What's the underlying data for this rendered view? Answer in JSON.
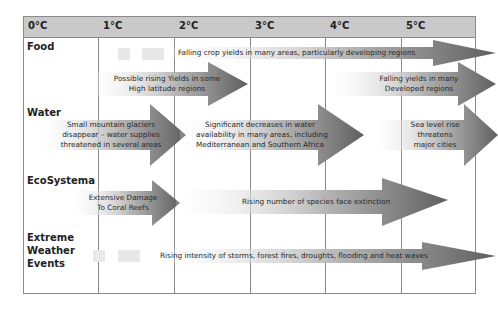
{
  "columns": [
    "0°C",
    "1°C",
    "2°C",
    "3°C",
    "4°C",
    "5°C"
  ],
  "rows": [
    {
      "label": "Food"
    },
    {
      "label": "Water"
    },
    {
      "label": "EcoSystema"
    },
    {
      "label_lines": [
        "Extreme",
        "Weather",
        "Events"
      ]
    }
  ],
  "impacts": {
    "food_falling_crop": "Falling crop yields in many areas, particularly developing regions",
    "food_rising_yields": [
      "Possible rising Yields in some",
      "High latitude regions"
    ],
    "food_falling_developed": [
      "Falling yields in many",
      "Developed regions"
    ],
    "water_glaciers": [
      "Small mountain glaciers",
      "disappear – water supplies",
      "threatened in several areas"
    ],
    "water_decreases": [
      "Significant decreases in water",
      "availability in many areas, including",
      "Mediterranean and Southern Africa"
    ],
    "water_sea_level": [
      "Sea level rise",
      "threatens",
      "major cities"
    ],
    "eco_coral": [
      "Extensive Damage",
      "To Coral Reefs"
    ],
    "eco_species": "Rising number of species face extinction",
    "weather_intensity": "Rising intensity of storms, forest fires, droughts, flooding and heat waves"
  },
  "colors": {
    "header_bg": "#c9c9c9",
    "grid_line": "#8a8a8a",
    "arrow_dark": "#666666",
    "arrow_light": "#ffffff"
  }
}
